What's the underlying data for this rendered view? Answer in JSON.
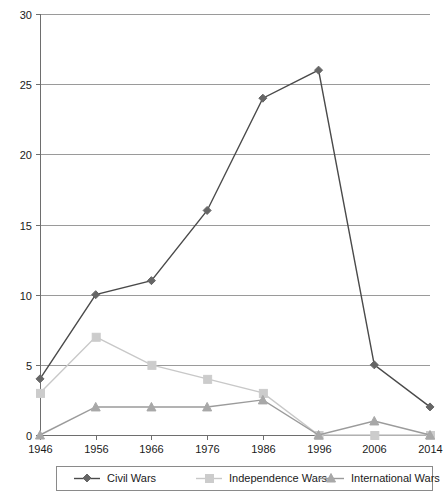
{
  "chart_data": {
    "type": "line",
    "title": "",
    "subtitle": "",
    "xlabel": "",
    "ylabel": "",
    "categories": [
      "1946",
      "1956",
      "1966",
      "1976",
      "1986",
      "1996",
      "2006",
      "2014"
    ],
    "x": [
      1946,
      1956,
      1966,
      1976,
      1986,
      1996,
      2006,
      2014
    ],
    "ylim": [
      0,
      30
    ],
    "yticks": [
      0,
      5,
      10,
      15,
      20,
      25,
      30
    ],
    "ytick_labels": [
      "0",
      "5",
      "10",
      "15",
      "20",
      "25",
      "30"
    ],
    "grid": true,
    "grid_axis": "y",
    "legend_position": "bottom",
    "series": [
      {
        "name": "Civil Wars",
        "values": [
          4,
          10,
          11,
          16,
          24,
          26,
          5,
          2
        ],
        "color": "#4a4a4a",
        "marker": "diamond",
        "marker_color": "#666666"
      },
      {
        "name": "Independence Wars",
        "values": [
          3,
          7,
          5,
          4,
          3,
          0,
          0,
          0
        ],
        "color": "#c8c8c8",
        "marker": "square",
        "marker_color": "#cccccc"
      },
      {
        "name": "International Wars",
        "values": [
          0,
          2,
          2,
          2,
          2.5,
          0,
          1,
          0
        ],
        "color": "#9b9b9b",
        "marker": "triangle",
        "marker_color": "#a8a8a8"
      }
    ]
  },
  "legend": {
    "items": [
      {
        "label": "Civil Wars"
      },
      {
        "label": "Independence Wars"
      },
      {
        "label": "International Wars"
      }
    ]
  },
  "axes": {
    "y": {
      "labels": [
        "30",
        "25",
        "20",
        "15",
        "10",
        "5",
        "0"
      ]
    },
    "x": {
      "labels": [
        "1946",
        "1956",
        "1966",
        "1976",
        "1986",
        "1996",
        "2006",
        "2014"
      ]
    }
  }
}
